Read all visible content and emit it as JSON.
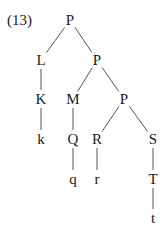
{
  "example_number": "(13)",
  "tree": {
    "nodes": [
      {
        "id": "n0",
        "label": "P",
        "x": 70,
        "y": 20
      },
      {
        "id": "n1",
        "label": "L",
        "x": 41,
        "y": 60
      },
      {
        "id": "n2",
        "label": "P",
        "x": 97,
        "y": 60
      },
      {
        "id": "n3",
        "label": "K",
        "x": 41,
        "y": 99
      },
      {
        "id": "n4",
        "label": "M",
        "x": 73,
        "y": 99
      },
      {
        "id": "n5",
        "label": "P",
        "x": 124,
        "y": 99
      },
      {
        "id": "n6",
        "label": "k",
        "x": 41,
        "y": 139
      },
      {
        "id": "n7",
        "label": "Q",
        "x": 73,
        "y": 139
      },
      {
        "id": "n8",
        "label": "R",
        "x": 97,
        "y": 139
      },
      {
        "id": "n9",
        "label": "S",
        "x": 153,
        "y": 139
      },
      {
        "id": "n10",
        "label": "q",
        "x": 73,
        "y": 179
      },
      {
        "id": "n11",
        "label": "r",
        "x": 97,
        "y": 179
      },
      {
        "id": "n12",
        "label": "T",
        "x": 153,
        "y": 179
      },
      {
        "id": "n13",
        "label": "t",
        "x": 153,
        "y": 218
      }
    ],
    "edges": [
      [
        "n0",
        "n1"
      ],
      [
        "n0",
        "n2"
      ],
      [
        "n1",
        "n3"
      ],
      [
        "n2",
        "n4"
      ],
      [
        "n2",
        "n5"
      ],
      [
        "n3",
        "n6"
      ],
      [
        "n4",
        "n7"
      ],
      [
        "n5",
        "n8"
      ],
      [
        "n5",
        "n9"
      ],
      [
        "n7",
        "n10"
      ],
      [
        "n8",
        "n11"
      ],
      [
        "n9",
        "n12"
      ],
      [
        "n12",
        "n13"
      ]
    ]
  }
}
